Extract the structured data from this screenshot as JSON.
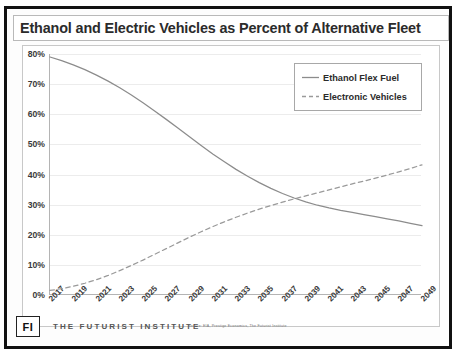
{
  "slide": {
    "title": "Ethanol and Electric Vehicles as Percent of Alternative Fleet",
    "footer": {
      "logo": "FI",
      "organization": "THE FUTURIST INSTITUTE",
      "source": "Source:  EIA, Prestige Economics, The Futurist Institute"
    }
  },
  "colors": {
    "ethanol_line": "#8c8c8c",
    "ev_line": "#9a9a9a",
    "gridline": "#ececec",
    "axis": "#b4b4b4",
    "frame": "#111111",
    "title_text": "#2b2b2b"
  },
  "chart_data": {
    "type": "line",
    "title": "Ethanol and Electric Vehicles as Percent of Alternative Fleet",
    "xlabel": "",
    "ylabel": "",
    "grid": true,
    "legend_position": "top-right",
    "ylim": [
      0,
      80
    ],
    "ytick_labels": [
      "0%",
      "10%",
      "20%",
      "30%",
      "40%",
      "50%",
      "60%",
      "70%",
      "80%"
    ],
    "ytick_values": [
      0,
      10,
      20,
      30,
      40,
      50,
      60,
      70,
      80
    ],
    "x": [
      2017,
      2018,
      2019,
      2020,
      2021,
      2022,
      2023,
      2024,
      2025,
      2026,
      2027,
      2028,
      2029,
      2030,
      2031,
      2032,
      2033,
      2034,
      2035,
      2036,
      2037,
      2038,
      2039,
      2040,
      2041,
      2042,
      2043,
      2044,
      2045,
      2046,
      2047,
      2048,
      2049
    ],
    "xtick_labels": [
      "2017",
      "2019",
      "2021",
      "2023",
      "2025",
      "2027",
      "2029",
      "2031",
      "2033",
      "2035",
      "2037",
      "2039",
      "2041",
      "2043",
      "2045",
      "2047",
      "2049"
    ],
    "series": [
      {
        "name": "Ethanol Flex Fuel",
        "style": "solid",
        "values": [
          79.0,
          77.8,
          76.4,
          74.8,
          73.0,
          71.0,
          68.8,
          66.4,
          63.8,
          61.1,
          58.3,
          55.4,
          52.5,
          49.6,
          46.8,
          44.2,
          41.7,
          39.4,
          37.3,
          35.4,
          33.7,
          32.2,
          30.9,
          29.8,
          28.9,
          28.1,
          27.4,
          26.7,
          26.0,
          25.3,
          24.6,
          23.8,
          23.0
        ]
      },
      {
        "name": "Electronic Vehicles",
        "style": "dashed",
        "values": [
          1.5,
          2.1,
          2.9,
          3.9,
          5.1,
          6.5,
          8.1,
          9.8,
          11.6,
          13.5,
          15.4,
          17.3,
          19.2,
          21.0,
          22.7,
          24.3,
          25.8,
          27.2,
          28.5,
          29.7,
          30.8,
          31.9,
          32.9,
          33.9,
          34.9,
          35.9,
          36.9,
          37.8,
          38.8,
          39.8,
          40.9,
          42.0,
          43.2
        ]
      }
    ]
  },
  "legend": {
    "items": [
      {
        "label": "Ethanol Flex Fuel",
        "style": "solid"
      },
      {
        "label": "Electronic Vehicles",
        "style": "dashed"
      }
    ]
  }
}
